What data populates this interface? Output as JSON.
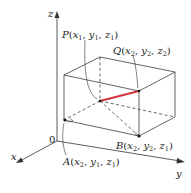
{
  "diagram": {
    "axes": {
      "x_label": "x",
      "y_label": "y",
      "z_label": "z",
      "origin_label": "0"
    },
    "points": {
      "P": {
        "name": "P",
        "coords": [
          "x",
          "1",
          "y",
          "1",
          "z",
          "1"
        ]
      },
      "Q": {
        "name": "Q",
        "coords": [
          "x",
          "2",
          "y",
          "2",
          "z",
          "2"
        ]
      },
      "A": {
        "name": "A",
        "coords": [
          "x",
          "2",
          "y",
          "1",
          "z",
          "1"
        ]
      },
      "B": {
        "name": "B",
        "coords": [
          "x",
          "2",
          "y",
          "2",
          "z",
          "1"
        ]
      }
    },
    "colors": {
      "segment_PQ": "#d0343a",
      "lines": "#222222",
      "axes": "#333333"
    }
  }
}
